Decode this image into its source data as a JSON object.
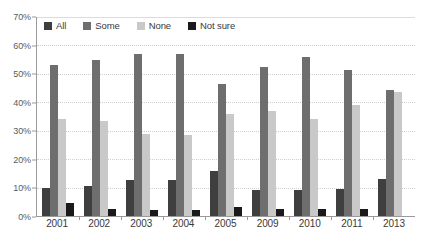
{
  "chart_data": {
    "type": "bar",
    "title": "",
    "xlabel": "",
    "ylabel": "",
    "ylim": [
      0,
      70
    ],
    "ytick_step": 10,
    "ytick_labels": [
      "0%",
      "10%",
      "20%",
      "30%",
      "40%",
      "50%",
      "60%",
      "70%"
    ],
    "grid": true,
    "legend_position": "top-left-inside",
    "categories": [
      "2001",
      "2002",
      "2003",
      "2004",
      "2005",
      "2009",
      "2010",
      "2011",
      "2013"
    ],
    "series": [
      {
        "name": "All",
        "color": "#3f3f3f",
        "values": [
          10,
          10.5,
          12.5,
          12.5,
          16,
          9,
          9,
          9.5,
          13
        ]
      },
      {
        "name": "Some",
        "color": "#6e6e6e",
        "values": [
          53,
          55,
          57,
          57,
          46.5,
          52.5,
          56,
          51.5,
          44.5
        ]
      },
      {
        "name": "None",
        "color": "#c9c9c9",
        "values": [
          34,
          33.5,
          29,
          28.5,
          36,
          37,
          34,
          39,
          43.5
        ]
      },
      {
        "name": "Not sure",
        "color": "#1a1a1a",
        "values": [
          4.5,
          2.5,
          2,
          2,
          3,
          2.5,
          2.5,
          2.5,
          0
        ]
      }
    ]
  },
  "legend": {
    "items": [
      {
        "label": "All",
        "color": "#3f3f3f"
      },
      {
        "label": "Some",
        "color": "#6e6e6e"
      },
      {
        "label": "None",
        "color": "#c9c9c9"
      },
      {
        "label": "Not sure",
        "color": "#1a1a1a"
      }
    ]
  },
  "axis_colors": {
    "axis_line": "#9a9a9a",
    "gridline": "#cfcfcf",
    "tick_text": "#5b5b5b",
    "category_text": "#3a3a3a"
  }
}
